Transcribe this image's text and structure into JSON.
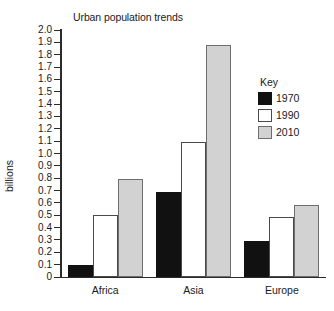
{
  "chart_data": {
    "type": "bar",
    "title": "Urban population trends",
    "xlabel": "",
    "ylabel": "billions",
    "categories": [
      "Africa",
      "Asia",
      "Europe"
    ],
    "series": [
      {
        "name": "1970",
        "color": "#111111",
        "values": [
          0.1,
          0.69,
          0.29
        ]
      },
      {
        "name": "1990",
        "color": "#ffffff",
        "values": [
          0.5,
          1.09,
          0.49
        ]
      },
      {
        "name": "2010",
        "color": "#d2d2d2",
        "values": [
          0.79,
          1.88,
          0.58
        ]
      }
    ],
    "ylim": [
      0,
      2.0
    ],
    "ytick_step": 0.1,
    "ytick_labels": [
      "2.0",
      "1.9",
      "1.8",
      "1.7",
      "1.6",
      "1.5",
      "1.4",
      "1.3",
      "1.2",
      "1.1",
      "1.0",
      "0.9",
      "0.8",
      "0.7",
      "0.6",
      "0.5",
      "0.4",
      "0.3",
      "0.2",
      "0.1",
      "0"
    ],
    "grid": false,
    "legend": {
      "title": "Key",
      "position": "upper-right-inside",
      "entries": [
        {
          "label": "1970",
          "swatch": "black-filled"
        },
        {
          "label": "1990",
          "swatch": "white-filled"
        },
        {
          "label": "2010",
          "swatch": "gray-filled"
        }
      ]
    }
  }
}
